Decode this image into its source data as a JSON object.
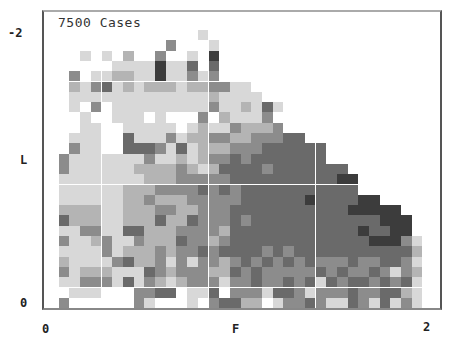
{
  "chart_data": {
    "type": "heatmap",
    "title": "7500 Cases",
    "xlabel": "F",
    "ylabel": "L",
    "x_ticks": [
      "0",
      "2"
    ],
    "y_ticks": [
      "-2",
      "0"
    ],
    "grid": false,
    "value_scale": "0=empty, 1=lightest grey ... 5=darkest grey",
    "rows_top_to_bottom": [
      "00000000000000100000000000000000000",
      "00000000000300010000000000000000000",
      "00010102003001050000000000000000000",
      "00000011115114040000000000000000000",
      "00301122115113130000000000000000000",
      "00213412122212233110000000000000000",
      "00111111111111121111000000000000000",
      "00103011111111131121410000000000000",
      "00010011101000302111300000000000000",
      "00011001111101211322230000000000000",
      "00111004111312233223334400000000000",
      "00311004443141222333444444000000000",
      "03111111131121233434444444000000000",
      "03111111222232124444344444440000000",
      "01111111122233333444444444455000000",
      "01111112223333434344444444444000000",
      "01111112232223333344444454444550000",
      "02222112223322333444444444445555500",
      "04222112224224333434444444444445550",
      "01133114422233332444444444444544550",
      "03112311322243323444444444444455531",
      "01111312223233434444343444444444442",
      "02111134223131332343434343334334431",
      "03122211143233322434333334343343132",
      "01133314132123331334334341434434341",
      "00111000334401140333144313334334421",
      "03000000310001034422013343114314131"
    ],
    "palette": [
      "#ffffff",
      "#d8d8d8",
      "#b4b4b4",
      "#8c8c8c",
      "#6a6a6a",
      "#3c3c3c"
    ]
  }
}
